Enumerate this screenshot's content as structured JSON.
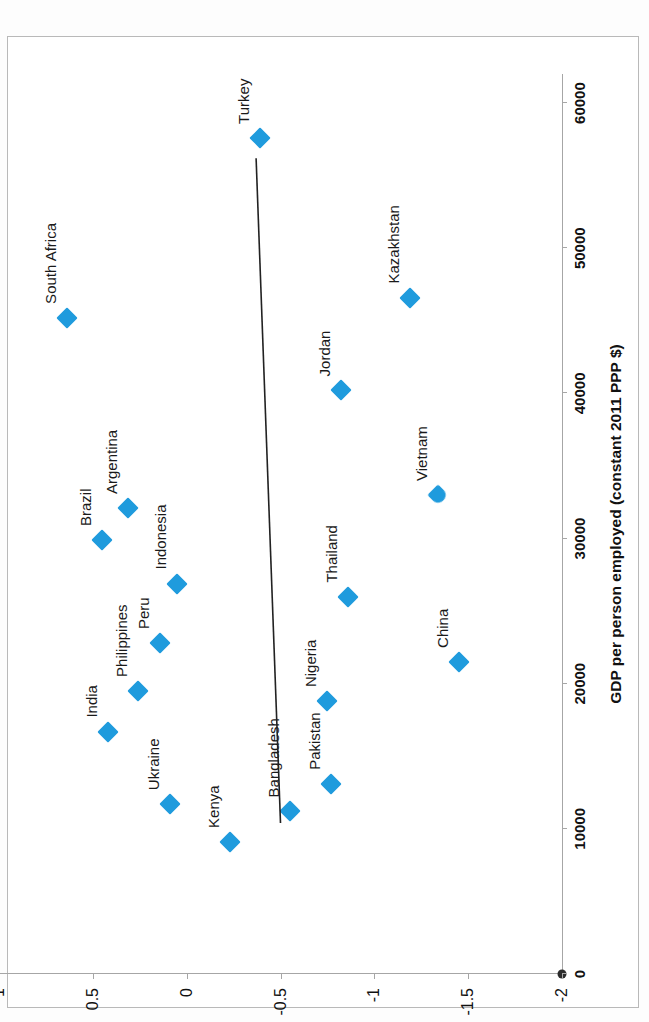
{
  "chart_data": {
    "type": "scatter",
    "title": "",
    "xlabel": "GDP per person employed (constant 2011 PPP $)",
    "ylabel": "Voice and Accountability",
    "xlim": [
      0,
      62000
    ],
    "ylim": [
      -2,
      1
    ],
    "xticks": [
      0,
      10000,
      20000,
      30000,
      40000,
      50000,
      60000
    ],
    "xticklabels": [
      "0",
      "10000",
      "20000",
      "30000",
      "40000",
      "50000",
      "60000"
    ],
    "yticks": [
      1,
      0.5,
      0,
      -0.5,
      -1,
      -1.5,
      -2
    ],
    "yticklabels": [
      "1",
      "0.5",
      "0",
      "-0.5",
      "-1",
      "-1.5",
      "-2"
    ],
    "grid": false,
    "legend": "none",
    "marker_color": "#1f9bdd",
    "marker_shape": "diamond",
    "points": [
      {
        "label": "Kenya",
        "x": 9100,
        "y": -0.23
      },
      {
        "label": "Bangladesh",
        "x": 11200,
        "y": -0.55
      },
      {
        "label": "Ukraine",
        "x": 11700,
        "y": 0.09
      },
      {
        "label": "Pakistan",
        "x": 13100,
        "y": -0.77
      },
      {
        "label": "India",
        "x": 16700,
        "y": 0.42
      },
      {
        "label": "Nigeria",
        "x": 18800,
        "y": -0.75
      },
      {
        "label": "Philippines",
        "x": 19500,
        "y": 0.26
      },
      {
        "label": "China",
        "x": 21500,
        "y": -1.45
      },
      {
        "label": "Peru",
        "x": 22800,
        "y": 0.14
      },
      {
        "label": "Thailand",
        "x": 26000,
        "y": -0.86
      },
      {
        "label": "Indonesia",
        "x": 26900,
        "y": 0.05
      },
      {
        "label": "Brazil",
        "x": 29900,
        "y": 0.45
      },
      {
        "label": "Argentina",
        "x": 32100,
        "y": 0.31
      },
      {
        "label": "Vietnam",
        "x": 33000,
        "y": -1.34
      },
      {
        "label": "Jordan",
        "x": 40200,
        "y": -0.82
      },
      {
        "label": "Kazakhstan",
        "x": 46600,
        "y": -1.19
      },
      {
        "label": "South Africa",
        "x": 45200,
        "y": 0.64
      },
      {
        "label": "Turkey",
        "x": 57600,
        "y": -0.39
      }
    ],
    "trendline": {
      "present": true,
      "color": "#222222",
      "x_start": 56200,
      "y_start": -0.37,
      "x_end": 10400,
      "y_end": -0.5
    }
  },
  "axis": {
    "origin_marker": "origin-dot"
  }
}
